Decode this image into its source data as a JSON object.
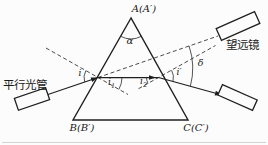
{
  "labels": {
    "vertex_a": "A(A′)",
    "vertex_b": "B(B′)",
    "vertex_c": "C(C′)",
    "apex_angle": "α",
    "deviation_angle": "δ",
    "incidence_angle": "i",
    "refraction_angle_1": {
      "base": "i",
      "sub": "1"
    },
    "refraction_angle_2": {
      "base": "i",
      "sub": "2"
    },
    "exit_angle": "i′",
    "collimator": "平行光管",
    "telescope": "望远镜"
  },
  "colors": {
    "ink": "#1f1f1f",
    "background": "#fcfcfc",
    "faint_rule": "#c9c9c9"
  }
}
